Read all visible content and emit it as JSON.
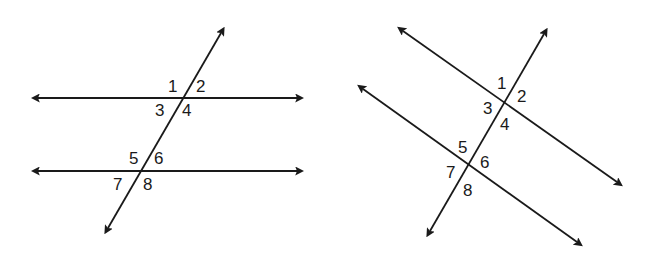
{
  "figures": [
    {
      "name": "horizontal-parallel-lines",
      "description": "Two horizontal parallel lines cut by a transversal",
      "lines": {
        "parallel_1": {
          "x1": 38,
          "y1": 98,
          "x2": 297,
          "y2": 98
        },
        "parallel_2": {
          "x1": 38,
          "y1": 171,
          "x2": 297,
          "y2": 171
        },
        "transversal": {
          "x1": 221,
          "y1": 33,
          "x2": 108,
          "y2": 228
        }
      },
      "angles": [
        {
          "label": "1",
          "x": 168,
          "y": 92
        },
        {
          "label": "2",
          "x": 196,
          "y": 92
        },
        {
          "label": "3",
          "x": 155,
          "y": 116
        },
        {
          "label": "4",
          "x": 182,
          "y": 116
        },
        {
          "label": "5",
          "x": 129,
          "y": 164
        },
        {
          "label": "6",
          "x": 154,
          "y": 164
        },
        {
          "label": "7",
          "x": 113,
          "y": 190
        },
        {
          "label": "8",
          "x": 143,
          "y": 190
        }
      ]
    },
    {
      "name": "slanted-parallel-lines",
      "description": "Two slanted parallel lines cut by a transversal",
      "lines": {
        "parallel_1": {
          "x1": 403,
          "y1": 31,
          "x2": 617,
          "y2": 182
        },
        "parallel_2": {
          "x1": 363,
          "y1": 89,
          "x2": 577,
          "y2": 242
        },
        "transversal": {
          "x1": 544,
          "y1": 34,
          "x2": 430,
          "y2": 231
        }
      },
      "angles": [
        {
          "label": "1",
          "x": 497,
          "y": 89
        },
        {
          "label": "2",
          "x": 517,
          "y": 102
        },
        {
          "label": "3",
          "x": 483,
          "y": 114
        },
        {
          "label": "4",
          "x": 500,
          "y": 130
        },
        {
          "label": "5",
          "x": 458,
          "y": 153
        },
        {
          "label": "6",
          "x": 480,
          "y": 168
        },
        {
          "label": "7",
          "x": 446,
          "y": 178
        },
        {
          "label": "8",
          "x": 463,
          "y": 196
        }
      ]
    }
  ],
  "colors": {
    "line": "#1a1a1a",
    "background": "#ffffff"
  }
}
